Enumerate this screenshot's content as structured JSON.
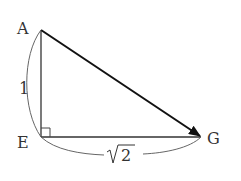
{
  "diagram": {
    "type": "right-triangle-vector",
    "points": {
      "A": {
        "label": "A",
        "x": 41,
        "y": 30
      },
      "E": {
        "label": "E",
        "x": 41,
        "y": 137
      },
      "G": {
        "label": "G",
        "x": 201,
        "y": 137
      }
    },
    "vector": {
      "from": "A",
      "to": "G"
    },
    "right_angle_at": "E",
    "sides": {
      "AE": {
        "length_label": "1"
      },
      "EG": {
        "length_label_radical": "√",
        "length_label_value": "2"
      }
    },
    "colors": {
      "line": "#333333",
      "arrow": "#111111",
      "arc": "#555555"
    }
  }
}
